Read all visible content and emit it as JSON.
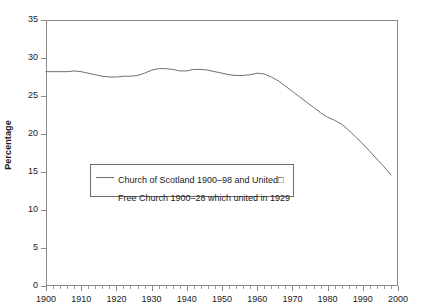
{
  "chart_data": {
    "type": "line",
    "title": "",
    "xlabel": "",
    "ylabel": "Percentage",
    "xlim": [
      1900,
      2000
    ],
    "ylim": [
      0,
      35
    ],
    "grid": false,
    "legend_position": "inside-lower-left",
    "x_ticks": [
      1900,
      1910,
      1920,
      1930,
      1940,
      1950,
      1960,
      1970,
      1980,
      1990,
      2000
    ],
    "y_ticks": [
      0,
      5,
      10,
      15,
      20,
      25,
      30,
      35
    ],
    "x_minor_tick_step": 2,
    "series": [
      {
        "name": "Church of Scotland 1900–98 and United Free Church 1900–28 which united in 1929",
        "color": "#6e6e6e",
        "x": [
          1900,
          1902,
          1904,
          1906,
          1908,
          1910,
          1912,
          1914,
          1916,
          1918,
          1920,
          1922,
          1924,
          1926,
          1928,
          1930,
          1932,
          1934,
          1936,
          1938,
          1940,
          1942,
          1944,
          1946,
          1948,
          1950,
          1952,
          1954,
          1956,
          1958,
          1960,
          1962,
          1964,
          1966,
          1968,
          1970,
          1972,
          1974,
          1976,
          1978,
          1980,
          1982,
          1984,
          1986,
          1988,
          1990,
          1992,
          1994,
          1996,
          1998
        ],
        "y": [
          28.2,
          28.2,
          28.2,
          28.2,
          28.3,
          28.2,
          28.0,
          27.8,
          27.6,
          27.5,
          27.5,
          27.6,
          27.6,
          27.7,
          28.0,
          28.4,
          28.6,
          28.6,
          28.5,
          28.3,
          28.3,
          28.5,
          28.5,
          28.4,
          28.2,
          28.0,
          27.8,
          27.7,
          27.7,
          27.8,
          28.0,
          27.9,
          27.5,
          27.0,
          26.3,
          25.6,
          24.9,
          24.2,
          23.5,
          22.8,
          22.2,
          21.8,
          21.3,
          20.5,
          19.6,
          18.7,
          17.7,
          16.7,
          15.7,
          14.6
        ]
      }
    ],
    "legend": {
      "line1": "Church of Scotland 1900–98 and United□",
      "line2": "Free Church 1900–28 which united in 1929"
    }
  },
  "axes": {
    "y_title": "Percentage",
    "y_tick_labels": [
      "35",
      "30",
      "25",
      "20",
      "15",
      "10",
      "5",
      "0"
    ],
    "x_tick_labels": [
      "1900",
      "1910",
      "1920",
      "1930",
      "1940",
      "1950",
      "1960",
      "1970",
      "1980",
      "1990",
      "2000"
    ]
  },
  "colors": {
    "line": "#6e6e6e",
    "frame": "#8a8a8a",
    "text": "#1a1a1a",
    "background": "#ffffff"
  }
}
